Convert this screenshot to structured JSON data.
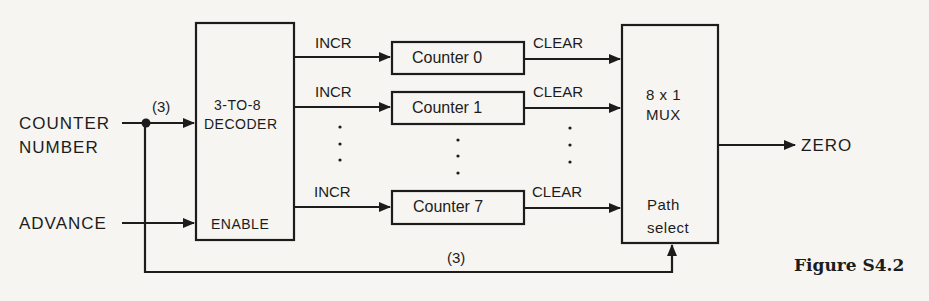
{
  "inputs": {
    "counter_number_line1": "COUNTER",
    "counter_number_line2": "NUMBER",
    "advance": "ADVANCE",
    "bus_width_top": "(3)",
    "bus_width_bottom": "(3)"
  },
  "decoder": {
    "line1": "3-TO-8",
    "line2": "DECODER",
    "enable": "ENABLE"
  },
  "counters": [
    {
      "name": "Counter 0",
      "in_label": "INCR",
      "out_label": "CLEAR"
    },
    {
      "name": "Counter 1",
      "in_label": "INCR",
      "out_label": "CLEAR"
    },
    {
      "name": "Counter 7",
      "in_label": "INCR",
      "out_label": "CLEAR"
    }
  ],
  "ellipsis": ":",
  "mux": {
    "line1": "8 x 1",
    "line2": "MUX",
    "select_line1": "Path",
    "select_line2": "select"
  },
  "output": {
    "label": "ZERO"
  },
  "caption": "Figure S4.2",
  "colors": {
    "background": "#f6f5f1",
    "ink": "#1c1c1c"
  }
}
